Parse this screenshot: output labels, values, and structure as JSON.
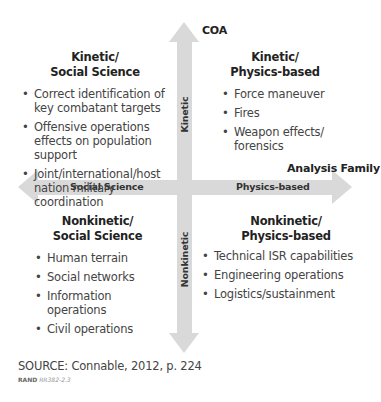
{
  "axes": {
    "vertical_title": "COA",
    "horizontal_title": "Analysis Family",
    "vertical_up_label": "Kinetic",
    "vertical_down_label": "Nonkinetic",
    "horizontal_left_label": "Social Science",
    "horizontal_right_label": "Physics-based",
    "arrow_color": "#d9d9d9"
  },
  "quadrants": {
    "top_left": {
      "title_line1": "Kinetic/",
      "title_line2": "Social Science",
      "items": [
        "Correct identification of key combatant targets",
        "Offensive operations effects on population support",
        "Joint/international/host nation military coordination"
      ]
    },
    "top_right": {
      "title_line1": "Kinetic/",
      "title_line2": "Physics-based",
      "items": [
        "Force maneuver",
        "Fires",
        "Weapon effects/ forensics"
      ]
    },
    "bottom_left": {
      "title_line1": "Nonkinetic/",
      "title_line2": "Social Science",
      "items": [
        "Human terrain",
        "Social networks",
        "Information operations",
        "Civil operations"
      ]
    },
    "bottom_right": {
      "title_line1": "Nonkinetic/",
      "title_line2": "Physics-based",
      "items": [
        "Technical ISR capabilities",
        "Engineering operations",
        "Logistics/sustainment"
      ]
    }
  },
  "footer": {
    "source": "SOURCE: Connable, 2012, p. 224",
    "publisher": "RAND",
    "figure_id": "RR382-2.3"
  }
}
